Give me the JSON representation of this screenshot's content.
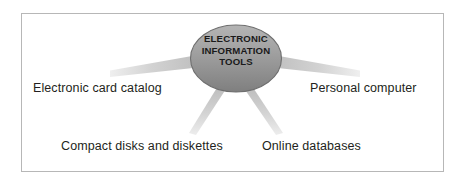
{
  "diagram": {
    "type": "hub-and-spoke concept map",
    "center": {
      "id": "electronic-information-tools",
      "lines": [
        "ELECTRONIC",
        "INFORMATION",
        "TOOLS"
      ],
      "shape": "ellipse",
      "fill_color": "#9a9a9a",
      "stroke_color": "#6e6e6e",
      "text_color": "#1a1a1a"
    },
    "nodes": [
      {
        "id": "electronic-card-catalog",
        "label": "Electronic card catalog",
        "position": "left"
      },
      {
        "id": "personal-computer",
        "label": "Personal computer",
        "position": "right"
      },
      {
        "id": "compact-disks-and-diskettes",
        "label": "Compact disks and diskettes",
        "position": "bottom-left"
      },
      {
        "id": "online-databases",
        "label": "Online databases",
        "position": "bottom-right"
      }
    ],
    "connector_color": "#c9c9c9",
    "frame_color": "#b7b7b7",
    "background_color": "#ffffff",
    "label_color": "#231f20"
  }
}
